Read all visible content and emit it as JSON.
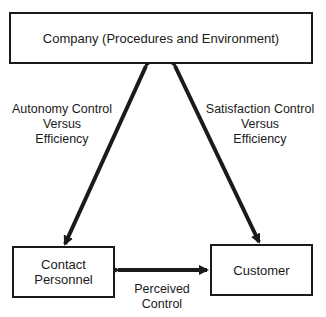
{
  "diagram": {
    "nodes": {
      "company": {
        "label": "Company (Procedures and Environment)"
      },
      "contact_personnel": {
        "label_lines": [
          "Contact",
          "Personnel"
        ]
      },
      "customer": {
        "label": "Customer"
      }
    },
    "edges": {
      "company_contact": {
        "label_lines": [
          "Autonomy Control",
          "Versus",
          "Efficiency"
        ],
        "direction": "bidirectional"
      },
      "company_customer": {
        "label_lines": [
          "Satisfaction Control",
          "Versus",
          "Efficiency"
        ],
        "direction": "bidirectional"
      },
      "contact_customer": {
        "label_lines": [
          "Perceived",
          "Control"
        ],
        "direction": "bidirectional"
      }
    },
    "colors": {
      "stroke": "#1a1a1a",
      "background": "#ffffff"
    }
  }
}
